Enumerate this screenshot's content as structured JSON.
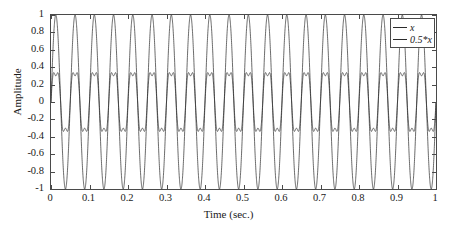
{
  "chart_data": {
    "type": "line",
    "title": "",
    "xlabel": "Time (sec.)",
    "ylabel": "Amplitude",
    "xlim": [
      0,
      1
    ],
    "ylim": [
      -1,
      1
    ],
    "grid": false,
    "legend_position": "top-right",
    "xticks": [
      0,
      0.1,
      0.2,
      0.3,
      0.4,
      0.5,
      0.6,
      0.7,
      0.8,
      0.9,
      1
    ],
    "xtick_labels": [
      "0",
      "0.1",
      "0.2",
      "0.3",
      "0.4",
      "0.5",
      "0.6",
      "0.7",
      "0.8",
      "0.9",
      "1"
    ],
    "yticks": [
      1,
      0.8,
      0.6,
      0.4,
      0.2,
      0,
      -0.2,
      -0.4,
      -0.6,
      -0.8,
      -1
    ],
    "ytick_labels": [
      "1",
      "0.8",
      "0.6",
      "0.4",
      "0.2",
      "0",
      "-0.2",
      "-0.4",
      "-0.6",
      "-0.8",
      "-1"
    ],
    "series": [
      {
        "name": "x",
        "legend_label": "x",
        "color": "#2b2b2b",
        "peak_amplitude": 1,
        "frequency_hz": 20,
        "waveform": "sinusoid",
        "description": "Full-amplitude 20 Hz oscillation spanning -1 to 1"
      },
      {
        "name": "0.5*x",
        "legend_label": "0.5*x",
        "color": "#2b2b2b",
        "peak_amplitude": 0.47,
        "frequency_hz": 20,
        "waveform": "modulated-sinusoid",
        "description": "Half-scaled 20 Hz oscillation with double-humped peaks near +/-0.47"
      }
    ]
  },
  "axes": {
    "x_title": "Time (sec.)",
    "y_title": "Amplitude"
  },
  "legend": {
    "entries": [
      {
        "label": "x"
      },
      {
        "label": "0.5*x"
      }
    ]
  }
}
